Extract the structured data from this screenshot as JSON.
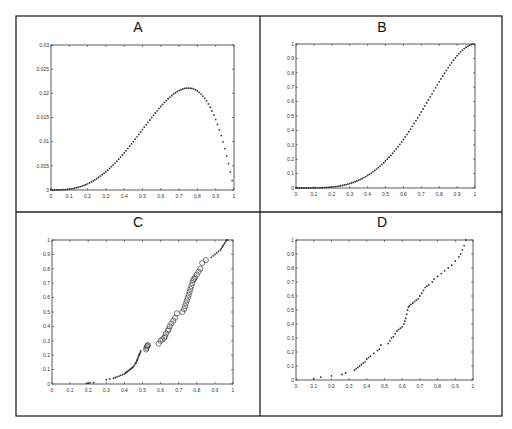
{
  "figure": {
    "width": 512,
    "height": 429,
    "frame": {
      "x": 16,
      "y": 16,
      "w": 486,
      "h": 400
    },
    "dividers": {
      "vertical_x": 260,
      "horizontal_y": 212
    }
  },
  "chart_data": [
    {
      "panel": "A",
      "title": "A",
      "type": "scatter",
      "marker": "dot",
      "xlabel": "",
      "ylabel": "",
      "xlim": [
        0,
        1
      ],
      "ylim": [
        0,
        0.03
      ],
      "xticks": [
        0,
        0.1,
        0.2,
        0.3,
        0.4,
        0.5,
        0.6,
        0.7,
        0.8,
        0.9,
        1
      ],
      "xticklabels": [
        "0",
        "0.1",
        "0.2",
        "0.3",
        "0.4",
        "0.5",
        "0.6",
        "0.7",
        "0.8",
        "0.9",
        "1"
      ],
      "yticks": [
        0,
        0.005,
        0.01,
        0.015,
        0.02,
        0.025,
        0.03
      ],
      "yticklabels": [
        "0",
        "0.005",
        "0.01",
        "0.015",
        "0.02",
        "0.025",
        "0.03"
      ],
      "grid": false,
      "description": "density curve, rises from 0 to peak ~0.021 at x~0.75, falls to ~0.002 at x~0.99",
      "function": "0.2*x^3*(1-x)",
      "n_points": 100,
      "axes_px": {
        "x": 51,
        "y": 45,
        "w": 183,
        "h": 145
      }
    },
    {
      "panel": "B",
      "title": "B",
      "type": "scatter",
      "marker": "dot",
      "xlabel": "",
      "ylabel": "",
      "xlim": [
        0,
        1
      ],
      "ylim": [
        0,
        1
      ],
      "xticks": [
        0,
        0.1,
        0.2,
        0.3,
        0.4,
        0.5,
        0.6,
        0.7,
        0.8,
        0.9,
        1
      ],
      "xticklabels": [
        "0",
        "0.1",
        "0.2",
        "0.3",
        "0.4",
        "0.5",
        "0.6",
        "0.7",
        "0.8",
        "0.9",
        "1"
      ],
      "yticks": [
        0,
        0.1,
        0.2,
        0.3,
        0.4,
        0.5,
        0.6,
        0.7,
        0.8,
        0.9,
        1
      ],
      "yticklabels": [
        "0",
        "0.1",
        "0.2",
        "0.3",
        "0.4",
        "0.5",
        "0.6",
        "0.7",
        "0.8",
        "0.9",
        "1"
      ],
      "grid": false,
      "description": "cumulative S-curve from 0 to 1",
      "function": "5*x^4-4*x^5",
      "n_points": 100,
      "axes_px": {
        "x": 296,
        "y": 44,
        "w": 179,
        "h": 144
      }
    },
    {
      "panel": "C",
      "title": "C",
      "type": "scatter",
      "xlabel": "",
      "ylabel": "",
      "xlim": [
        0,
        1
      ],
      "ylim": [
        0,
        1
      ],
      "xticks": [
        0,
        0.1,
        0.2,
        0.3,
        0.4,
        0.5,
        0.6,
        0.7,
        0.8,
        0.9,
        1
      ],
      "xticklabels": [
        "0",
        "0.1",
        "0.2",
        "0.3",
        "0.4",
        "0.5",
        "0.6",
        "0.7",
        "0.8",
        "0.9",
        "1"
      ],
      "yticks": [
        0,
        0.1,
        0.2,
        0.3,
        0.4,
        0.5,
        0.6,
        0.7,
        0.8,
        0.9,
        1
      ],
      "yticklabels": [
        "0",
        "0.1",
        "0.2",
        "0.3",
        "0.4",
        "0.5",
        "0.6",
        "0.7",
        "0.8",
        "0.9",
        "1"
      ],
      "grid": false,
      "axes_px": {
        "x": 52,
        "y": 240,
        "w": 181,
        "h": 144
      },
      "series": [
        {
          "name": "filled-low",
          "marker": "dot",
          "x": [
            0.19,
            0.2,
            0.21,
            0.23,
            0.3,
            0.32,
            0.34,
            0.35,
            0.36,
            0.37,
            0.38,
            0.39,
            0.4,
            0.405,
            0.41,
            0.415,
            0.42,
            0.425,
            0.43,
            0.435,
            0.44,
            0.445,
            0.45,
            0.455,
            0.46,
            0.462,
            0.465,
            0.468,
            0.47,
            0.472,
            0.475,
            0.478,
            0.48,
            0.482,
            0.485,
            0.488,
            0.49
          ],
          "y": [
            0.005,
            0.006,
            0.008,
            0.01,
            0.03,
            0.035,
            0.04,
            0.045,
            0.05,
            0.055,
            0.06,
            0.065,
            0.07,
            0.075,
            0.08,
            0.085,
            0.09,
            0.095,
            0.1,
            0.105,
            0.11,
            0.115,
            0.12,
            0.13,
            0.14,
            0.145,
            0.15,
            0.16,
            0.165,
            0.17,
            0.18,
            0.19,
            0.2,
            0.205,
            0.21,
            0.22,
            0.23
          ]
        },
        {
          "name": "open-mid-a",
          "marker": "circle",
          "x": [
            0.52,
            0.522,
            0.525,
            0.527,
            0.53
          ],
          "y": [
            0.24,
            0.25,
            0.26,
            0.265,
            0.27
          ]
        },
        {
          "name": "open-mid",
          "marker": "circle",
          "x": [
            0.59,
            0.6,
            0.61,
            0.62,
            0.625,
            0.63,
            0.64,
            0.645,
            0.65,
            0.66,
            0.67,
            0.68,
            0.69,
            0.72,
            0.73,
            0.735,
            0.74,
            0.745,
            0.75,
            0.755,
            0.76,
            0.765,
            0.77,
            0.775,
            0.78,
            0.785,
            0.79,
            0.8,
            0.81,
            0.82,
            0.83,
            0.85
          ],
          "y": [
            0.28,
            0.3,
            0.31,
            0.32,
            0.33,
            0.35,
            0.37,
            0.38,
            0.4,
            0.42,
            0.44,
            0.46,
            0.49,
            0.5,
            0.52,
            0.54,
            0.56,
            0.58,
            0.6,
            0.62,
            0.64,
            0.66,
            0.68,
            0.7,
            0.72,
            0.73,
            0.74,
            0.76,
            0.78,
            0.8,
            0.84,
            0.86
          ]
        },
        {
          "name": "filled-high",
          "marker": "dot",
          "x": [
            0.88,
            0.89,
            0.9,
            0.91,
            0.92,
            0.93,
            0.935,
            0.94,
            0.945,
            0.95,
            0.955,
            0.96,
            0.965,
            0.97
          ],
          "y": [
            0.88,
            0.89,
            0.9,
            0.91,
            0.92,
            0.93,
            0.94,
            0.95,
            0.96,
            0.97,
            0.98,
            0.99,
            1.0,
            1.0
          ]
        }
      ]
    },
    {
      "panel": "D",
      "title": "D",
      "type": "scatter",
      "marker": "dot",
      "xlabel": "",
      "ylabel": "",
      "xlim": [
        0,
        1
      ],
      "ylim": [
        0,
        1
      ],
      "xticks": [
        0,
        0.1,
        0.2,
        0.3,
        0.4,
        0.5,
        0.6,
        0.7,
        0.8,
        0.9,
        1
      ],
      "xticklabels": [
        "0",
        "0.1",
        "0.2",
        "0.3",
        "0.4",
        "0.5",
        "0.6",
        "0.7",
        "0.8",
        "0.9",
        "1"
      ],
      "yticks": [
        0,
        0.1,
        0.2,
        0.3,
        0.4,
        0.5,
        0.6,
        0.7,
        0.8,
        0.9,
        1
      ],
      "yticklabels": [
        "0",
        "0.1",
        "0.2",
        "0.3",
        "0.4",
        "0.5",
        "0.6",
        "0.7",
        "0.8",
        "0.9",
        "1"
      ],
      "grid": false,
      "axes_px": {
        "x": 296,
        "y": 240,
        "w": 177,
        "h": 140
      },
      "x": [
        0.1,
        0.14,
        0.2,
        0.26,
        0.28,
        0.33,
        0.34,
        0.35,
        0.36,
        0.37,
        0.38,
        0.39,
        0.4,
        0.41,
        0.42,
        0.44,
        0.46,
        0.47,
        0.48,
        0.52,
        0.53,
        0.54,
        0.55,
        0.56,
        0.57,
        0.58,
        0.59,
        0.6,
        0.61,
        0.615,
        0.62,
        0.625,
        0.63,
        0.635,
        0.64,
        0.65,
        0.66,
        0.67,
        0.68,
        0.69,
        0.7,
        0.71,
        0.72,
        0.73,
        0.74,
        0.75,
        0.77,
        0.78,
        0.8,
        0.82,
        0.84,
        0.86,
        0.88,
        0.9,
        0.92,
        0.93,
        0.94,
        0.95,
        0.96
      ],
      "y": [
        0.01,
        0.02,
        0.03,
        0.04,
        0.05,
        0.07,
        0.08,
        0.09,
        0.1,
        0.11,
        0.12,
        0.13,
        0.15,
        0.16,
        0.17,
        0.19,
        0.21,
        0.22,
        0.25,
        0.26,
        0.28,
        0.3,
        0.31,
        0.33,
        0.35,
        0.36,
        0.37,
        0.38,
        0.4,
        0.42,
        0.44,
        0.47,
        0.5,
        0.52,
        0.53,
        0.54,
        0.55,
        0.56,
        0.57,
        0.58,
        0.6,
        0.62,
        0.64,
        0.66,
        0.67,
        0.68,
        0.7,
        0.72,
        0.74,
        0.76,
        0.78,
        0.8,
        0.82,
        0.85,
        0.88,
        0.9,
        0.93,
        0.96,
        1.0
      ]
    }
  ]
}
